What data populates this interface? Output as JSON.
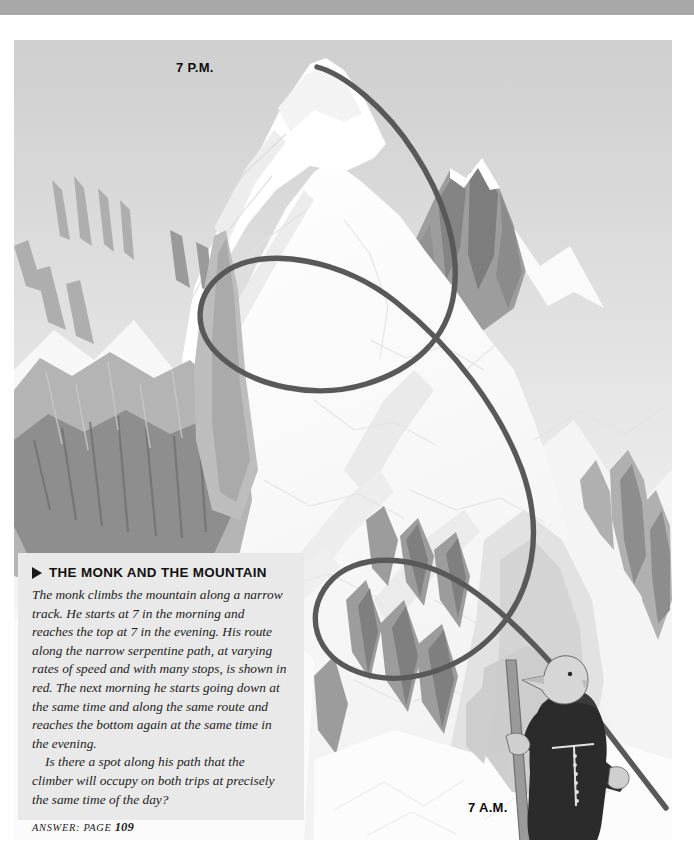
{
  "page": {
    "width": 694,
    "height": 863,
    "background_color": "#ffffff",
    "top_band_color": "#a8a8a8"
  },
  "illustration": {
    "name": "mountain-illustration",
    "description": "Grayscale drawing of a snowy mountain massif with jagged rock faces and a serpentine climbing path",
    "palette": {
      "snow_white": "#fbfbfb",
      "snow_shade_light": "#ededed",
      "snow_shade_mid": "#dcdcdc",
      "rock_light": "#c6c6c6",
      "rock_mid": "#a9a9a9",
      "rock_dark": "#858585",
      "path_color": "#595959",
      "sky_top": "#cfcfcf",
      "sky_bottom": "#fafafa"
    }
  },
  "labels": {
    "summit_time": "7 P.M.",
    "base_time": "7 A.M."
  },
  "textbox": {
    "title": "THE MONK AND THE MOUNTAIN",
    "marker_icon": "triangle-right-icon",
    "background_color": "#e9e9e9",
    "paragraphs": [
      "The monk climbs the mountain along a narrow track. He starts at 7 in the morning and reaches the top at 7 in the evening. His route along the narrow serpentine path, at varying rates of speed and with many stops, is shown in red. The next morning he starts going down at the same time and along the same route and reaches the bottom again at the same time in the evening.",
      "Is there a spot along his path that the climber will occupy on both trips at precisely the same time of the day?"
    ],
    "answer_prefix": "ANSWER: PAGE",
    "answer_page": "109"
  },
  "monk": {
    "name": "monk-figure",
    "robe_color": "#2b2b2b",
    "skin_color": "#d6d6d6",
    "staff_color": "#9a9a9a",
    "rope_belt_color": "#e8e8e8"
  }
}
